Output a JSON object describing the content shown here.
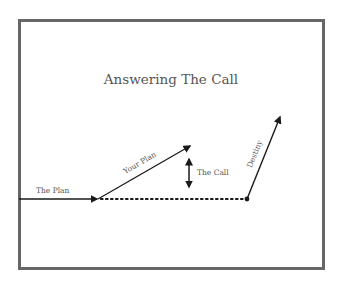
{
  "diagram": {
    "title": "Answering The Call",
    "labels": {
      "the_plan": "The Plan",
      "your_plan": "Your Plan",
      "the_call": "The Call",
      "destiny": "Destiny"
    },
    "colors": {
      "frame": "#666666",
      "line": "#1a1a1a",
      "text": "#555555"
    },
    "edges": [
      {
        "name": "The Plan",
        "from": [
          19,
          199
        ],
        "to": [
          98,
          199
        ],
        "style": "solid",
        "head": "end"
      },
      {
        "name": "Your Plan",
        "from": [
          98,
          199
        ],
        "to": [
          191,
          145
        ],
        "style": "solid",
        "head": "end"
      },
      {
        "name": "The Call",
        "from": [
          189,
          157
        ],
        "to": [
          189,
          189
        ],
        "style": "solid",
        "head": "both"
      },
      {
        "name": "dotted-path",
        "from": [
          98,
          199
        ],
        "to": [
          247,
          199
        ],
        "style": "dotted",
        "head": "none"
      },
      {
        "name": "Destiny",
        "from": [
          247,
          199
        ],
        "to": [
          281,
          115
        ],
        "style": "solid",
        "head": "end"
      }
    ]
  }
}
